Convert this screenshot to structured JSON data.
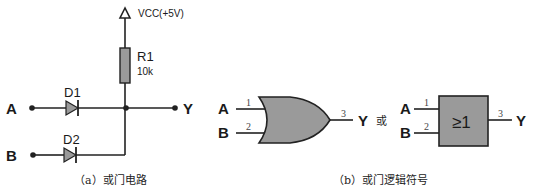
{
  "circuit": {
    "vcc_label": "VCC(+5V)",
    "resistor": {
      "name": "R1",
      "value": "10k"
    },
    "diodes": [
      {
        "name": "D1"
      },
      {
        "name": "D2"
      }
    ],
    "inputs": [
      "A",
      "B"
    ],
    "output": "Y",
    "caption": "（a）或门电路"
  },
  "symbols": {
    "or_gate": {
      "inputs": [
        {
          "label": "A",
          "pin": "1"
        },
        {
          "label": "B",
          "pin": "2"
        }
      ],
      "output": {
        "label": "Y",
        "pin": "3"
      }
    },
    "connector": "或",
    "iec_gate": {
      "inputs": [
        {
          "label": "A",
          "pin": "1"
        },
        {
          "label": "B",
          "pin": "2"
        }
      ],
      "function": "≥1",
      "output": {
        "label": "Y",
        "pin": "3"
      }
    },
    "caption": "（b）或门逻辑符号"
  },
  "colors": {
    "component_fill": "#9a9a9a",
    "wire": "#222222"
  }
}
